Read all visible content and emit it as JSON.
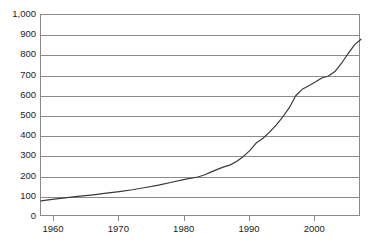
{
  "chart_data": {
    "type": "line",
    "title": "",
    "subtitle": "",
    "xlabel": "",
    "ylabel": "",
    "xlim": [
      1958,
      2007
    ],
    "ylim": [
      0,
      1000
    ],
    "grid": "horizontal",
    "legend": "none",
    "y_ticks": [
      0,
      100,
      200,
      300,
      400,
      500,
      600,
      700,
      800,
      900,
      1000
    ],
    "y_tick_labels": [
      "0",
      "100",
      "200",
      "300",
      "400",
      "500",
      "600",
      "700",
      "800",
      "900",
      "1,000"
    ],
    "x_ticks": [
      1960,
      1970,
      1980,
      1990,
      2000
    ],
    "x_tick_labels": [
      "1960",
      "1970",
      "1980",
      "1990",
      "2000"
    ],
    "series": [
      {
        "name": "series-1",
        "color": "#3a3a3a",
        "x": [
          1958,
          1960,
          1962,
          1964,
          1966,
          1968,
          1970,
          1972,
          1974,
          1976,
          1978,
          1980,
          1982,
          1983,
          1984,
          1985,
          1986,
          1987,
          1988,
          1989,
          1990,
          1991,
          1992,
          1993,
          1994,
          1995,
          1996,
          1997,
          1998,
          1999,
          2000,
          2001,
          2002,
          2003,
          2004,
          2005,
          2006,
          2007
        ],
        "values": [
          80,
          88,
          96,
          103,
          110,
          118,
          126,
          135,
          146,
          158,
          172,
          186,
          198,
          208,
          222,
          236,
          248,
          258,
          276,
          300,
          330,
          368,
          390,
          420,
          455,
          495,
          540,
          600,
          632,
          650,
          668,
          688,
          698,
          720,
          760,
          808,
          852,
          880
        ]
      }
    ],
    "colors": {
      "axis": "#8a8a8a",
      "grid": "#8a8a8a",
      "text": "#1c1c1c",
      "line": "#3a3a3a",
      "background": "#ffffff"
    }
  }
}
